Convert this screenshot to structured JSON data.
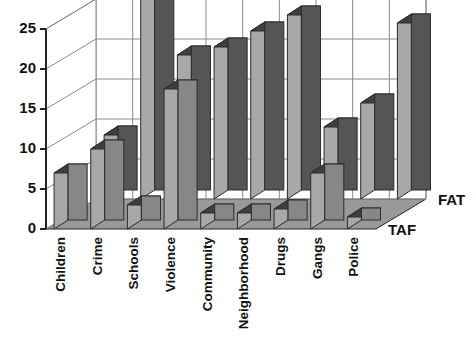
{
  "chart_data": {
    "type": "bar",
    "title": "",
    "subtitle": "",
    "xlabel": "",
    "ylabel": "",
    "render": "3d-grouped-bar",
    "grid": true,
    "legend_position": "right-axis-labels",
    "ylim": [
      0,
      25
    ],
    "yticks": [
      0,
      5,
      10,
      15,
      20,
      25
    ],
    "ytick_labels": [
      "0",
      "5",
      "10",
      "15",
      "20",
      "25"
    ],
    "categories": [
      "Children",
      "Crime",
      "Schools",
      "Violence",
      "Community",
      "Neighborhood",
      "Drugs",
      "Gangs",
      "Police"
    ],
    "series": [
      {
        "name": "FAT",
        "color": "#5a5a5a",
        "values": [
          8,
          25,
          18,
          19,
          21,
          23,
          9,
          12,
          22
        ]
      },
      {
        "name": "TAF",
        "color": "#8c8c8c",
        "values": [
          7,
          10,
          3,
          17.5,
          2,
          2,
          2.5,
          7,
          1.5
        ]
      }
    ]
  },
  "colors": {
    "bar_front_back_series": "#555555",
    "bar_front_front_series": "#878787",
    "bar_side_light": "#a8a8a8",
    "bar_top": "#3f3f3f",
    "floor": "#999999",
    "grid_line": "#888888",
    "axis_line": "#222222",
    "background": "#ffffff",
    "text": "#111111"
  }
}
